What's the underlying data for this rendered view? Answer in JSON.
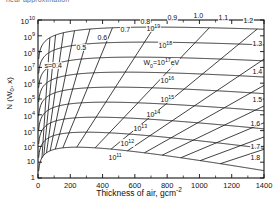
{
  "page": {
    "top_caption": "near approximation"
  },
  "chart_data": {
    "type": "line",
    "title": "",
    "xlabel": "Thickness of air, gcm",
    "xlabel_exponent": "-2",
    "ylabel": "N (W",
    "ylabel_sub": "0",
    "ylabel_tail": ", x)",
    "xlim": [
      0,
      1400
    ],
    "ylim_log": [
      0,
      10
    ],
    "grid": false,
    "legend": "inline-curve-labels",
    "xticks": [
      "0",
      "200",
      "400",
      "600",
      "800",
      "1000",
      "1200",
      "1400"
    ],
    "xtick_values": [
      0,
      200,
      400,
      600,
      800,
      1000,
      1200,
      1400
    ],
    "yticks": [
      "1",
      "10",
      "10",
      "10",
      "10",
      "10",
      "10",
      "10",
      "10",
      "10",
      "10"
    ],
    "ytick_exponents": [
      "",
      "",
      "2",
      "3",
      "4",
      "5",
      "6",
      "7",
      "8",
      "9",
      "10"
    ],
    "ytick_values": [
      1,
      10,
      100,
      1000,
      10000,
      100000,
      1000000,
      10000000,
      100000000,
      1000000000,
      10000000000
    ],
    "energy_series_label": "W",
    "energy_series_sub": "0",
    "energy_series_eq": "=10",
    "energy_series_exp": "17",
    "energy_series_unit": "eV",
    "energy_curves": [
      {
        "label": "10",
        "exponent": "19",
        "peak_log_n": 9.55,
        "peak_depth": 720
      },
      {
        "label": "10",
        "exponent": "18",
        "peak_log_n": 8.6,
        "peak_depth": 660
      },
      {
        "label": "10",
        "exponent": "17",
        "peak_log_n": 7.65,
        "peak_depth": 600
      },
      {
        "label": "10",
        "exponent": "16",
        "peak_log_n": 6.7,
        "peak_depth": 540
      },
      {
        "label": "10",
        "exponent": "15",
        "peak_log_n": 5.75,
        "peak_depth": 480
      },
      {
        "label": "10",
        "exponent": "14",
        "peak_log_n": 4.8,
        "peak_depth": 420
      },
      {
        "label": "10",
        "exponent": "13",
        "peak_log_n": 3.85,
        "peak_depth": 360
      },
      {
        "label": "10",
        "exponent": "12",
        "peak_log_n": 2.9,
        "peak_depth": 300
      },
      {
        "label": "10",
        "exponent": "11",
        "peak_log_n": 1.95,
        "peak_depth": 240
      }
    ],
    "age_parameter_label": "s=0.4",
    "age_curves": [
      {
        "label": "s=0.4",
        "s": 0.4
      },
      {
        "label": "0.5",
        "s": 0.5
      },
      {
        "label": "0.6",
        "s": 0.6
      },
      {
        "label": "0.7",
        "s": 0.7
      },
      {
        "label": "0.8",
        "s": 0.8
      },
      {
        "label": "0.9",
        "s": 0.9
      },
      {
        "label": "1.0",
        "s": 1.0
      },
      {
        "label": "1.1",
        "s": 1.1
      },
      {
        "label": "1.2",
        "s": 1.2
      },
      {
        "label": "1.3",
        "s": 1.3
      },
      {
        "label": "1.4",
        "s": 1.4
      },
      {
        "label": "1.5",
        "s": 1.5
      },
      {
        "label": "1.6",
        "s": 1.6
      },
      {
        "label": "1.7",
        "s": 1.7
      },
      {
        "label": "1.8",
        "s": 1.8
      }
    ],
    "colors": {
      "line": "#111111",
      "axis": "#111111",
      "background": "#ffffff"
    }
  }
}
